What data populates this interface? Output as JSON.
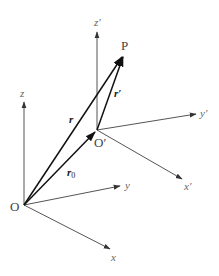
{
  "diagram": {
    "type": "coordinate-frame-translation",
    "colors": {
      "axis": "#555555",
      "vector": "#222222",
      "label": "#555555",
      "background": "#ffffff"
    },
    "origin_frame": {
      "origin_label": "O",
      "axes": {
        "x": "x",
        "y": "y",
        "z": "z"
      }
    },
    "moving_frame": {
      "origin_label": "O′",
      "axes": {
        "x": "x′",
        "y": "y′",
        "z": "z′"
      }
    },
    "point_label": "P",
    "vectors": {
      "r": "r",
      "r_prime": "r′",
      "r0_base": "r",
      "r0_sub": "0"
    }
  }
}
